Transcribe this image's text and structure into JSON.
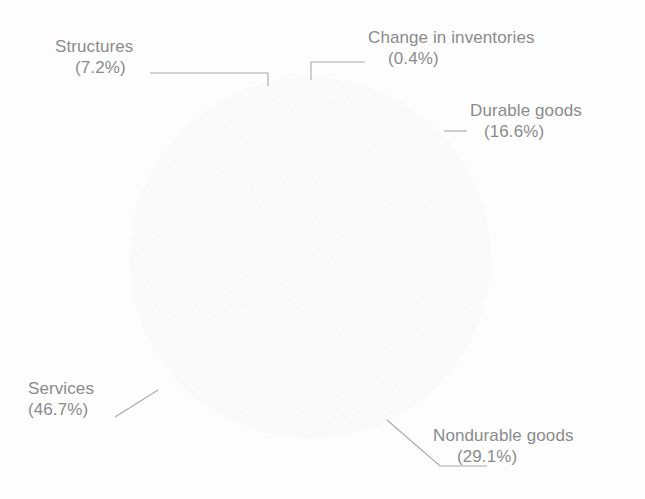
{
  "chart_data": {
    "type": "pie",
    "title": "",
    "subtitle": "",
    "xlabel": "",
    "ylabel": "",
    "legend_position": "none",
    "labels_position": "outside-with-leader-lines",
    "grid": false,
    "units": "percent",
    "total": 100.0,
    "start_angle_deg": 0,
    "direction": "clockwise",
    "categories": [
      "Change in inventories",
      "Durable goods",
      "Nondurable goods",
      "Services",
      "Structures"
    ],
    "values": [
      0.4,
      16.6,
      29.1,
      46.7,
      7.2
    ],
    "value_labels": [
      "(0.4%)",
      "(16.6%)",
      "(29.1%)",
      "(46.7%)",
      "(7.2%)"
    ],
    "slice_colors": [
      "#6e6e6e",
      "#e4e4e4",
      "#808080",
      "#787878",
      "#e9e9e9"
    ],
    "slices": [
      {
        "name": "Change in inventories",
        "value": 0.4,
        "value_label": "(0.4%)",
        "color": "#6e6e6e",
        "start_deg": 0.0,
        "end_deg": 1.44
      },
      {
        "name": "Durable goods",
        "value": 16.6,
        "value_label": "(16.6%)",
        "color": "#e4e4e4",
        "start_deg": 1.44,
        "end_deg": 61.2
      },
      {
        "name": "Nondurable goods",
        "value": 29.1,
        "value_label": "(29.1%)",
        "color": "#808080",
        "start_deg": 61.2,
        "end_deg": 166.0
      },
      {
        "name": "Services",
        "value": 46.7,
        "value_label": "(46.7%)",
        "color": "#787878",
        "start_deg": 166.0,
        "end_deg": 334.1
      },
      {
        "name": "Structures",
        "value": 7.2,
        "value_label": "(7.2%)",
        "color": "#e9e9e9",
        "start_deg": 334.1,
        "end_deg": 360.0
      }
    ]
  },
  "labels": {
    "change_in_inventories": {
      "name": "Change in inventories",
      "pct": "(0.4%)"
    },
    "durable_goods": {
      "name": "Durable goods",
      "pct": "(16.6%)"
    },
    "nondurable_goods": {
      "name": "Nondurable goods",
      "pct": "(29.1%)"
    },
    "services": {
      "name": "Services",
      "pct": "(46.7%)"
    },
    "structures": {
      "name": "Structures",
      "pct": "(7.2%)"
    }
  },
  "style": {
    "background": "#fdfdfd",
    "text_color": "#8b8b8b",
    "leader_line_color": "#a9a9a9",
    "slice_outline_color": "#f4f4f4"
  },
  "caption": {
    "clipped_text": ""
  }
}
